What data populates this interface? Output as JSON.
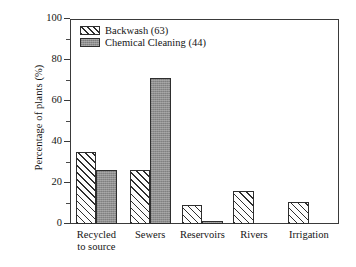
{
  "chart_data": {
    "type": "bar",
    "title": "",
    "subtitle": "",
    "xlabel": "",
    "ylabel": "Percentage of plants (%)",
    "ylim": [
      0,
      100
    ],
    "xlim_note": "categorical",
    "grid": false,
    "legend_position": "top-left (inside axes)",
    "y_major_ticks": [
      0,
      20,
      40,
      60,
      80,
      100
    ],
    "y_minor_ticks": [
      10,
      30,
      50,
      70,
      90
    ],
    "y_tick_labels": [
      "0",
      "20",
      "40",
      "60",
      "80",
      "100"
    ],
    "categories": [
      "Recycled to source",
      "Sewers",
      "Reservoirs",
      "Rivers",
      "Irrigation"
    ],
    "category_label_lines": [
      [
        "Recycled",
        "to source"
      ],
      [
        "Sewers"
      ],
      [
        "Reservoirs"
      ],
      [
        "Rivers"
      ],
      [
        "Irrigation"
      ]
    ],
    "series": [
      {
        "name": "Backwash (63)",
        "short_name": "Backwash",
        "count": 63,
        "fill": "diagonal-hatch",
        "color": "#ffffff",
        "edge_color": "#2e2e2e",
        "values": [
          35,
          26.5,
          9.5,
          16,
          10.5
        ]
      },
      {
        "name": "Chemical Cleaning (44)",
        "short_name": "Chemical Cleaning",
        "count": 44,
        "fill": "solid-gray",
        "color": "#8f8f8f",
        "edge_color": "#2e2e2e",
        "values": [
          26.5,
          71,
          1.5,
          0,
          0
        ]
      }
    ]
  },
  "legend": {
    "items": [
      {
        "label": "Backwash (63)",
        "swatch": "diagonal-hatch"
      },
      {
        "label": "Chemical Cleaning (44)",
        "swatch": "solid-gray"
      }
    ]
  },
  "axes": {
    "y_title": "Percentage of plants (%)"
  },
  "colors": {
    "background": "#ffffff",
    "axis": "#3a3a3a",
    "bar_edge": "#2e2e2e",
    "series_gray": "#8f8f8f",
    "text": "#141414"
  }
}
